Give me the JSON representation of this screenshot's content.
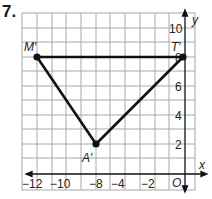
{
  "problem_number": "7.",
  "graph": {
    "axes": {
      "x_label": "x",
      "y_label": "y",
      "origin_label": "O"
    },
    "x_ticks": [
      {
        "label": "−12",
        "px": 31
      },
      {
        "label": "−10",
        "px": 58
      },
      {
        "label": "−8",
        "px": 96
      },
      {
        "label": "−4",
        "px": 117
      },
      {
        "label": "−2",
        "px": 147
      }
    ],
    "y_ticks": [
      {
        "label": "10",
        "py": 32
      },
      {
        "label": "8",
        "py": 61
      },
      {
        "label": "6",
        "py": 90
      },
      {
        "label": "4",
        "py": 119
      },
      {
        "label": "2",
        "py": 148
      }
    ],
    "points": [
      {
        "name": "M′",
        "x": -12,
        "y": 8
      },
      {
        "name": "T′",
        "x": -2,
        "y": 8
      },
      {
        "name": "A′",
        "x": -8,
        "y": 2
      }
    ],
    "triangle_color": "#111111",
    "grid_color": "#9a9a9a"
  }
}
